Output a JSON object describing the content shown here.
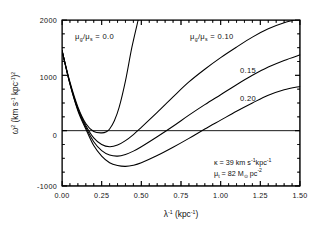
{
  "chart_data": {
    "type": "line",
    "title": "",
    "xlabel": "λ⁻¹ (kpc⁻¹)",
    "ylabel": "ω² (km s⁻¹ kpc⁻¹)²",
    "xlim": [
      0.0,
      1.5
    ],
    "ylim": [
      -1000,
      2000
    ],
    "xticks": [
      0.0,
      0.25,
      0.5,
      0.75,
      1.0,
      1.25,
      1.5
    ],
    "xticklabels": [
      "0.00",
      "0.25",
      "0.50",
      "0.75",
      "1.00",
      "1.25",
      "1.50"
    ],
    "yticks": [
      -1000,
      0,
      1000,
      2000
    ],
    "yticklabels": [
      "-1000",
      "0",
      "1000",
      "2000"
    ],
    "x_minor_step": 0.05,
    "y_minor_step": 250,
    "grid": false,
    "legend_position": "inline-curve-labels",
    "zero_reference_line": 0,
    "series": [
      {
        "name": "mu_g/mu_s = 0.0",
        "label": "0.0",
        "x": [
          0.0,
          0.05,
          0.1,
          0.15,
          0.2,
          0.25,
          0.28,
          0.3,
          0.33,
          0.36,
          0.4,
          0.44,
          0.48
        ],
        "values": [
          1450,
          880,
          430,
          130,
          -15,
          -40,
          -20,
          30,
          180,
          420,
          900,
          1500,
          2000
        ]
      },
      {
        "name": "mu_g/mu_s = 0.10",
        "label": "0.10",
        "x": [
          0.0,
          0.05,
          0.1,
          0.15,
          0.2,
          0.25,
          0.3,
          0.35,
          0.4,
          0.45,
          0.5,
          0.6,
          0.7,
          0.8,
          0.9,
          1.0,
          1.1,
          1.2,
          1.3,
          1.4,
          1.5
        ],
        "values": [
          1450,
          860,
          400,
          95,
          -130,
          -250,
          -290,
          -260,
          -180,
          -70,
          60,
          330,
          610,
          880,
          1110,
          1320,
          1510,
          1690,
          1840,
          1950,
          2020
        ]
      },
      {
        "name": "mu_g/mu_s = 0.15",
        "label": "0.15",
        "x": [
          0.0,
          0.05,
          0.1,
          0.15,
          0.2,
          0.25,
          0.3,
          0.35,
          0.4,
          0.45,
          0.5,
          0.6,
          0.7,
          0.8,
          0.9,
          1.0,
          1.1,
          1.2,
          1.3,
          1.4,
          1.5
        ],
        "values": [
          1450,
          850,
          380,
          60,
          -200,
          -360,
          -440,
          -460,
          -430,
          -370,
          -290,
          -110,
          80,
          280,
          470,
          650,
          830,
          1000,
          1150,
          1270,
          1370
        ]
      },
      {
        "name": "mu_g/mu_s = 0.20",
        "label": "0.20",
        "x": [
          0.0,
          0.05,
          0.1,
          0.15,
          0.2,
          0.25,
          0.3,
          0.35,
          0.4,
          0.45,
          0.5,
          0.6,
          0.7,
          0.8,
          0.9,
          1.0,
          1.1,
          1.2,
          1.3,
          1.4,
          1.5
        ],
        "values": [
          1450,
          840,
          360,
          30,
          -270,
          -460,
          -580,
          -630,
          -645,
          -625,
          -580,
          -450,
          -300,
          -140,
          30,
          190,
          350,
          500,
          640,
          740,
          800
        ]
      }
    ],
    "annotations": [
      {
        "name": "label-top-left",
        "text": "μ_g/μ_s = 0.0",
        "x": 0.18,
        "y": 1780
      },
      {
        "name": "label-top-right",
        "text": "μ_g/μ_s = 0.10",
        "x": 0.74,
        "y": 1780
      },
      {
        "name": "label-015",
        "text": "0.15",
        "x": 1.17,
        "y": 1060
      },
      {
        "name": "label-020",
        "text": "0.20",
        "x": 1.17,
        "y": 560
      },
      {
        "name": "param-kappa",
        "text": "κ = 39 km s⁻¹ kpc⁻¹",
        "x": 0.86,
        "y": -530
      },
      {
        "name": "param-mu-t",
        "text": "μ_t = 82 M⊙ pc⁻²",
        "x": 0.86,
        "y": -700
      }
    ]
  },
  "labels": {
    "y_axis": {
      "omega": "ω",
      "omega_exp": "2",
      "open_paren": " (km s",
      "s_exp": "-1",
      "kpc": " kpc",
      "kpc_exp": "-1",
      "close_paren": ")",
      "outer_exp": "2"
    },
    "x_axis": {
      "lambda": "λ",
      "lambda_exp": "-1",
      "units_open": " (kpc",
      "units_exp": "-1",
      "units_close": ")"
    },
    "curve_top_left": {
      "mu": "μ",
      "sub_g": "g",
      "slash": "/",
      "mu2": "μ",
      "sub_s": "s",
      "equals": " = 0.0"
    },
    "curve_top_right": {
      "mu": "μ",
      "sub_g": "g",
      "slash": "/",
      "mu2": "μ",
      "sub_s": "s",
      "equals": " = 0.10"
    },
    "curve_015": "0.15",
    "curve_020": "0.20",
    "annotation_kappa": {
      "kappa": "κ",
      "value": " = 39 km s",
      "exp1": "-1",
      "kpc": "kpc",
      "exp2": "-1"
    },
    "annotation_mu": {
      "mu": "μ",
      "sub_t": "t",
      "value": " = 82 M",
      "sun": "⊙",
      "pc": " pc",
      "exp": "-2"
    },
    "ytick_2000": "2000",
    "ytick_1000": "1000",
    "ytick_0": "0",
    "ytick_neg1000": "-1000",
    "xtick_000": "0.00",
    "xtick_025": "0.25",
    "xtick_050": "0.50",
    "xtick_075": "0.75",
    "xtick_100": "1.00",
    "xtick_125": "1.25",
    "xtick_150": "1.50"
  },
  "colors": {
    "background": "#ffffff",
    "ink": "#000000",
    "curve": "#000000"
  }
}
